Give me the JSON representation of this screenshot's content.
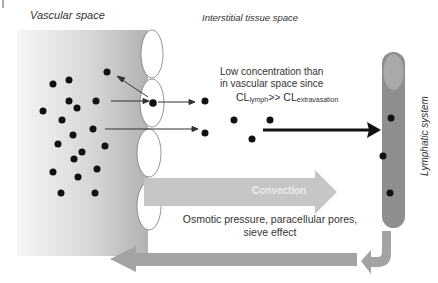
{
  "labels": {
    "vascular_space": "Vascular space",
    "interstitial_space": "Interstitial tissue space",
    "lymphatic_system": "Lymphatic system"
  },
  "note": {
    "line1": "Low concentration than",
    "line2": "in vascular space since",
    "cl_a": "CL",
    "cl_a_sub": "lymph",
    "cl_op": ">> CL",
    "cl_b_sub": "extravasation"
  },
  "convection": {
    "label": "Convection",
    "mechanism_line1": "Osmotic pressure, paracellular pores,",
    "mechanism_line2": "sieve effect"
  },
  "colors": {
    "vascular_gradient_left": "#f4f4f4",
    "vascular_gradient_right": "#b4b4b4",
    "lymph_vessel": "#8e8e8e",
    "lymph_top": "#a8a8a8",
    "convection_arrow": "#c6c6c6",
    "return_arrow": "#a3a3a3",
    "molecule": "#111111"
  }
}
